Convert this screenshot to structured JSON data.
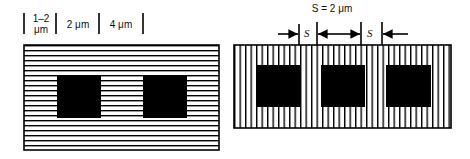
{
  "left_panel": {
    "orientation": "horizontal-lines",
    "line_spacing_px": 5,
    "squares": 2,
    "dimension_labels": [
      {
        "line1": "1–2",
        "line2": "μm"
      },
      {
        "line1": "2 μm"
      },
      {
        "line1": "4 μm"
      }
    ]
  },
  "right_panel": {
    "orientation": "vertical-lines",
    "line_spacing_px": 5.5,
    "squares": 3,
    "spacing_title": "S = 2 μm",
    "spacing_symbol_1": "S",
    "spacing_symbol_2": "S"
  },
  "colors": {
    "ink": "#000000",
    "background": "#ffffff"
  }
}
